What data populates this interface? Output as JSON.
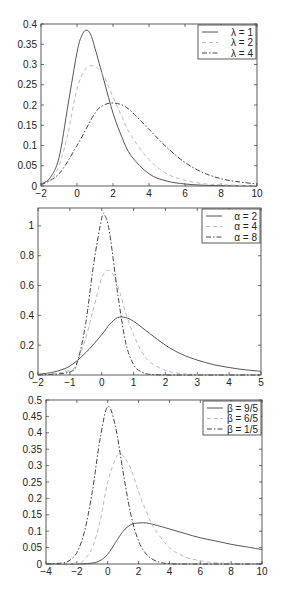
{
  "chart_data": [
    {
      "type": "line",
      "title": "",
      "xlabel": "",
      "ylabel": "",
      "xlim": [
        -2,
        10
      ],
      "ylim": [
        0,
        0.4
      ],
      "xticks": [
        -2,
        0,
        2,
        4,
        6,
        8,
        10
      ],
      "yticks": [
        0,
        0.05,
        0.1,
        0.15,
        0.2,
        0.25,
        0.3,
        0.35,
        0.4
      ],
      "ytick_labels": [
        "0",
        "0.05",
        "0.1",
        "0.15",
        "0.2",
        "0.25",
        "0.3",
        "0.35",
        "0.4"
      ],
      "legend_position": "upper right",
      "box": {
        "x0": 41,
        "y0": 24,
        "x1": 257,
        "y1": 186
      },
      "series": [
        {
          "name": "λ = 1",
          "style": "solid",
          "color": "#555555",
          "x": [
            -2,
            -1.5,
            -1,
            -0.5,
            0,
            0.25,
            0.5,
            0.75,
            1,
            1.5,
            2,
            2.5,
            3,
            4,
            5,
            6,
            7,
            8,
            10
          ],
          "y": [
            0.005,
            0.02,
            0.07,
            0.2,
            0.33,
            0.37,
            0.385,
            0.375,
            0.34,
            0.26,
            0.18,
            0.12,
            0.075,
            0.03,
            0.012,
            0.005,
            0.002,
            0.001,
            0
          ]
        },
        {
          "name": "λ = 2",
          "style": "dashed",
          "color": "#bbbbbb",
          "x": [
            -2,
            -1.5,
            -1,
            -0.5,
            0,
            0.5,
            1,
            1.5,
            2,
            2.5,
            3,
            4,
            5,
            6,
            7,
            8,
            10
          ],
          "y": [
            0.003,
            0.015,
            0.05,
            0.13,
            0.24,
            0.29,
            0.295,
            0.27,
            0.22,
            0.17,
            0.125,
            0.065,
            0.03,
            0.014,
            0.006,
            0.003,
            0.001
          ]
        },
        {
          "name": "λ = 4",
          "style": "dashdot",
          "color": "#444444",
          "x": [
            -2,
            -1,
            0,
            1,
            1.5,
            2,
            2.5,
            3,
            4,
            5,
            6,
            7,
            8,
            9,
            10
          ],
          "y": [
            0.003,
            0.03,
            0.1,
            0.18,
            0.2,
            0.205,
            0.2,
            0.185,
            0.14,
            0.095,
            0.058,
            0.033,
            0.018,
            0.01,
            0.005
          ]
        }
      ]
    },
    {
      "type": "line",
      "title": "",
      "xlabel": "",
      "ylabel": "",
      "xlim": [
        -2,
        5
      ],
      "ylim": [
        0,
        1.12
      ],
      "xticks": [
        -2,
        -1,
        0,
        1,
        2,
        3,
        4,
        5
      ],
      "xtick_labels": [
        "−2",
        "−1",
        "0",
        "1",
        "2",
        "3",
        "4",
        "5"
      ],
      "yticks": [
        0,
        0.2,
        0.4,
        0.6,
        0.8,
        1
      ],
      "ytick_labels": [
        "0",
        "0.2",
        "0.4",
        "0.6",
        "0.8",
        "1"
      ],
      "legend_position": "upper right",
      "box": {
        "x0": 38,
        "y0": 208,
        "x1": 261,
        "y1": 375
      },
      "series": [
        {
          "name": "α = 2",
          "style": "solid",
          "color": "#555555",
          "x": [
            -2,
            -1.5,
            -1,
            -0.5,
            0,
            0.25,
            0.5,
            0.75,
            1,
            1.5,
            2,
            2.5,
            3,
            3.5,
            4,
            4.5,
            5
          ],
          "y": [
            0.005,
            0.02,
            0.06,
            0.15,
            0.27,
            0.34,
            0.385,
            0.385,
            0.36,
            0.28,
            0.2,
            0.14,
            0.1,
            0.07,
            0.05,
            0.035,
            0.025
          ]
        },
        {
          "name": "α = 4",
          "style": "dashed",
          "color": "#bbbbbb",
          "x": [
            -2,
            -1,
            -0.75,
            -0.5,
            -0.25,
            0,
            0.25,
            0.5,
            0.75,
            1,
            1.25,
            1.5,
            2,
            2.5,
            3,
            4,
            5
          ],
          "y": [
            0,
            0.03,
            0.1,
            0.25,
            0.45,
            0.65,
            0.7,
            0.6,
            0.42,
            0.27,
            0.16,
            0.09,
            0.03,
            0.01,
            0.004,
            0.001,
            0
          ]
        },
        {
          "name": "α = 8",
          "style": "dashdot",
          "color": "#444444",
          "x": [
            -2,
            -1,
            -0.75,
            -0.5,
            -0.25,
            0,
            0.1,
            0.25,
            0.5,
            0.75,
            1,
            1.25,
            1.5,
            2,
            3,
            5
          ],
          "y": [
            0,
            0.02,
            0.1,
            0.35,
            0.75,
            1.05,
            1.07,
            0.95,
            0.55,
            0.22,
            0.07,
            0.02,
            0.005,
            0,
            0,
            0
          ]
        }
      ]
    },
    {
      "type": "line",
      "title": "",
      "xlabel": "",
      "ylabel": "",
      "xlim": [
        -4,
        10
      ],
      "ylim": [
        0,
        0.5
      ],
      "xticks": [
        -4,
        -2,
        0,
        2,
        4,
        6,
        8,
        10
      ],
      "xtick_labels": [
        "−4",
        "−2",
        "0",
        "2",
        "4",
        "6",
        "8",
        "10"
      ],
      "yticks": [
        0,
        0.05,
        0.1,
        0.15,
        0.2,
        0.25,
        0.3,
        0.35,
        0.4,
        0.45,
        0.5
      ],
      "ytick_labels": [
        "0",
        "0.05",
        "0.1",
        "0.15",
        "0.2",
        "0.25",
        "0.3",
        "0.35",
        "0.4",
        "0.45",
        "0.5"
      ],
      "legend_position": "upper right",
      "box": {
        "x0": 46,
        "y0": 400,
        "x1": 262,
        "y1": 564
      },
      "series": [
        {
          "name": "β = 9/5",
          "style": "solid",
          "color": "#555555",
          "x": [
            -4,
            -2,
            -1,
            -0.5,
            0,
            0.5,
            1,
            1.5,
            2,
            2.5,
            3,
            4,
            5,
            6,
            7,
            8,
            9,
            10
          ],
          "y": [
            0,
            0,
            0.003,
            0.01,
            0.03,
            0.065,
            0.1,
            0.12,
            0.125,
            0.125,
            0.12,
            0.107,
            0.093,
            0.08,
            0.07,
            0.06,
            0.052,
            0.044
          ]
        },
        {
          "name": "β = 6/5",
          "style": "dashed",
          "color": "#bbbbbb",
          "x": [
            -4,
            -2,
            -1.5,
            -1,
            -0.5,
            0,
            0.5,
            0.75,
            1,
            1.5,
            2,
            2.5,
            3,
            4,
            5,
            6,
            7,
            8,
            10
          ],
          "y": [
            0,
            0.003,
            0.015,
            0.05,
            0.13,
            0.25,
            0.32,
            0.335,
            0.33,
            0.29,
            0.22,
            0.16,
            0.11,
            0.05,
            0.022,
            0.01,
            0.004,
            0.002,
            0
          ]
        },
        {
          "name": "β = 1/5",
          "style": "dashdot",
          "color": "#444444",
          "x": [
            -4,
            -3,
            -2.5,
            -2,
            -1.5,
            -1,
            -0.5,
            0,
            0.5,
            1,
            1.5,
            2,
            2.5,
            3,
            3.5,
            4,
            5,
            10
          ],
          "y": [
            0,
            0.003,
            0.01,
            0.035,
            0.1,
            0.22,
            0.38,
            0.48,
            0.42,
            0.28,
            0.15,
            0.07,
            0.03,
            0.012,
            0.004,
            0.001,
            0,
            0
          ]
        }
      ]
    }
  ]
}
